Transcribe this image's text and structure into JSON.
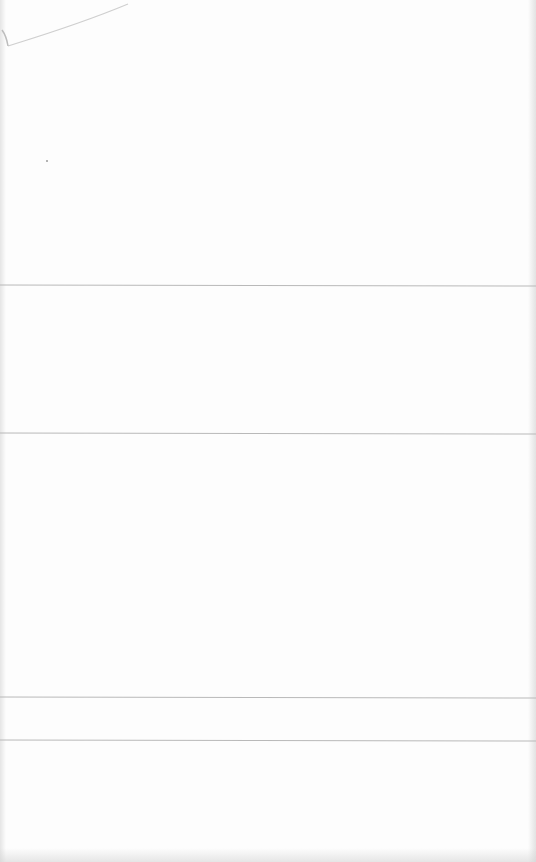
{
  "page": {
    "type": "blank ruled page",
    "background": "#fdfdfd",
    "rule_color": "#b9b9b9"
  },
  "rules": [
    {
      "y": 285
    },
    {
      "y": 433
    },
    {
      "y": 697
    },
    {
      "y": 740
    }
  ],
  "sections": [
    {
      "label": ""
    },
    {
      "label": ""
    },
    {
      "label": ""
    },
    {
      "label": ""
    },
    {
      "label": ""
    }
  ]
}
